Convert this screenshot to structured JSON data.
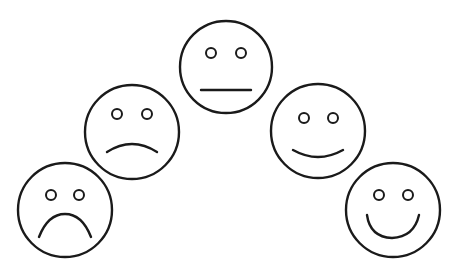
{
  "stroke_color": "#1a1a1a",
  "background": "#ffffff",
  "faces": [
    {
      "name": "very-sad",
      "mood": "very sad",
      "cx": 65,
      "cy": 210,
      "r": 47,
      "mouth": "deep-frown"
    },
    {
      "name": "sad",
      "mood": "sad",
      "cx": 132,
      "cy": 132,
      "r": 47,
      "mouth": "frown"
    },
    {
      "name": "neutral",
      "mood": "neutral",
      "cx": 226,
      "cy": 67,
      "r": 46,
      "mouth": "straight"
    },
    {
      "name": "happy",
      "mood": "happy",
      "cx": 318,
      "cy": 131,
      "r": 47,
      "mouth": "smile"
    },
    {
      "name": "very-happy",
      "mood": "very happy",
      "cx": 393,
      "cy": 210,
      "r": 47,
      "mouth": "big-smile"
    }
  ]
}
